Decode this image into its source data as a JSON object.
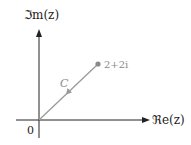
{
  "figure": {
    "y_axis_label": "ℑm(z)",
    "x_axis_label": "ℜe(z)",
    "origin_label": "0",
    "curve_label": "C",
    "point_label": "2+2i",
    "colors": {
      "axes": "#222222",
      "curve": "#9a9a9a",
      "point": "#8a8a8a",
      "background": "#ffffff"
    }
  }
}
